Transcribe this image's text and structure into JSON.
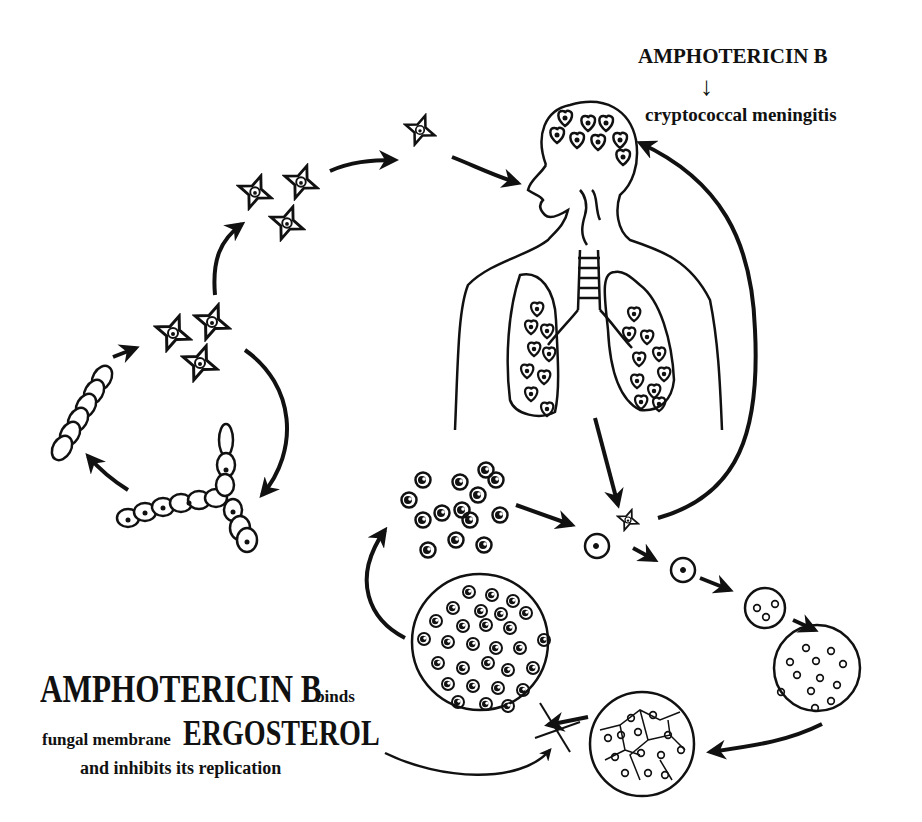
{
  "diagram": {
    "top_annotation": {
      "drug": "AMPHOTERICIN B",
      "arrow": "↓",
      "target_disease": "cryptococcal meningitis"
    },
    "bottom_annotation": {
      "line1_big": "AMPHOTERICIN B",
      "line1_small": "binds",
      "line2_small": "fungal membrane",
      "line2_big": "ERGOSTEROL",
      "line3": "and inhibits its replication"
    },
    "stages": [
      {
        "id": "hyphae-chain",
        "label": "mycelial chain"
      },
      {
        "id": "branching-hyphae",
        "label": "branching hyphae"
      },
      {
        "id": "spores-cluster-1",
        "label": "basidiospores"
      },
      {
        "id": "spores-cluster-2",
        "label": "airborne spores"
      },
      {
        "id": "single-spore",
        "label": "inhaled spore"
      },
      {
        "id": "human-host",
        "label": "human head and lungs infection"
      },
      {
        "id": "yeast-cells",
        "label": "encapsulated yeast cells"
      },
      {
        "id": "budding-progression",
        "label": "yeast development"
      },
      {
        "id": "cell-aggregate",
        "label": "cell aggregate"
      },
      {
        "id": "inhibited-replication",
        "label": "blocked replication (X)"
      }
    ],
    "colors": {
      "ink": "#111111",
      "background": "#ffffff"
    }
  }
}
